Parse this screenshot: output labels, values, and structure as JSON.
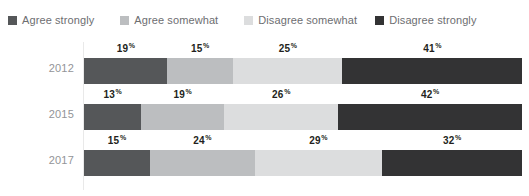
{
  "chart_data": {
    "type": "bar",
    "subtype": "stacked-horizontal-100",
    "title": "",
    "subtitle": "",
    "xlabel": "",
    "ylabel": "",
    "xlim": [
      0,
      100
    ],
    "grid": false,
    "legend_position": "top-left",
    "value_suffix": "%",
    "categories": [
      "2012",
      "2015",
      "2017"
    ],
    "series": [
      {
        "name": "Agree strongly",
        "color": "#555759",
        "values": [
          19,
          13,
          15
        ]
      },
      {
        "name": "Agree somewhat",
        "color": "#bcbec0",
        "values": [
          15,
          19,
          24
        ]
      },
      {
        "name": "Disagree somewhat",
        "color": "#dcddde",
        "values": [
          25,
          26,
          29
        ]
      },
      {
        "name": "Disagree strongly",
        "color": "#333334",
        "values": [
          41,
          42,
          32
        ]
      }
    ]
  },
  "legend": {
    "items": [
      {
        "label": "Agree strongly",
        "color": "#555759",
        "swatch_name": "legend-swatch-agree-strongly"
      },
      {
        "label": "Agree somewhat",
        "color": "#bcbec0",
        "swatch_name": "legend-swatch-agree-somewhat"
      },
      {
        "label": "Disagree somewhat",
        "color": "#dcddde",
        "swatch_name": "legend-swatch-disagree-somewhat"
      },
      {
        "label": "Disagree strongly",
        "color": "#333334",
        "swatch_name": "legend-swatch-disagree-strongly"
      }
    ]
  },
  "rows": [
    {
      "year": "2012",
      "segments": [
        {
          "label": "19",
          "suffix": "%",
          "value": 19,
          "color": "#555759",
          "series": "Agree strongly"
        },
        {
          "label": "15",
          "suffix": "%",
          "value": 15,
          "color": "#bcbec0",
          "series": "Agree somewhat"
        },
        {
          "label": "25",
          "suffix": "%",
          "value": 25,
          "color": "#dcddde",
          "series": "Disagree somewhat"
        },
        {
          "label": "41",
          "suffix": "%",
          "value": 41,
          "color": "#333334",
          "series": "Disagree strongly"
        }
      ]
    },
    {
      "year": "2015",
      "segments": [
        {
          "label": "13",
          "suffix": "%",
          "value": 13,
          "color": "#555759",
          "series": "Agree strongly"
        },
        {
          "label": "19",
          "suffix": "%",
          "value": 19,
          "color": "#bcbec0",
          "series": "Agree somewhat"
        },
        {
          "label": "26",
          "suffix": "%",
          "value": 26,
          "color": "#dcddde",
          "series": "Disagree somewhat"
        },
        {
          "label": "42",
          "suffix": "%",
          "value": 42,
          "color": "#333334",
          "series": "Disagree strongly"
        }
      ]
    },
    {
      "year": "2017",
      "segments": [
        {
          "label": "15",
          "suffix": "%",
          "value": 15,
          "color": "#555759",
          "series": "Agree strongly"
        },
        {
          "label": "24",
          "suffix": "%",
          "value": 24,
          "color": "#bcbec0",
          "series": "Agree somewhat"
        },
        {
          "label": "29",
          "suffix": "%",
          "value": 29,
          "color": "#dcddde",
          "series": "Disagree somewhat"
        },
        {
          "label": "32",
          "suffix": "%",
          "value": 32,
          "color": "#333334",
          "series": "Disagree strongly"
        }
      ]
    }
  ]
}
